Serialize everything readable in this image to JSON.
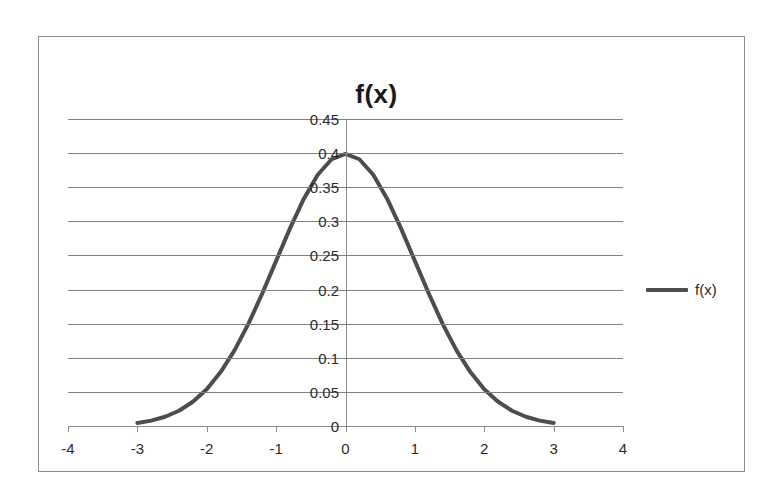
{
  "chart_data": {
    "type": "line",
    "title": "f(x)",
    "xlabel": "",
    "ylabel": "",
    "grid": true,
    "legend_position": "right",
    "legend": [
      "f(x)"
    ],
    "xlim": [
      -4,
      4
    ],
    "ylim": [
      0,
      0.45
    ],
    "x_ticks": [
      "-4",
      "-3",
      "-2",
      "-1",
      "0",
      "1",
      "2",
      "3",
      "4"
    ],
    "x_tick_values": [
      -4,
      -3,
      -2,
      -1,
      0,
      1,
      2,
      3,
      4
    ],
    "y_ticks": [
      "0",
      "0.05",
      "0.1",
      "0.15",
      "0.2",
      "0.25",
      "0.3",
      "0.35",
      "0.4",
      "0.45"
    ],
    "y_tick_values": [
      0,
      0.05,
      0.1,
      0.15,
      0.2,
      0.25,
      0.3,
      0.35,
      0.4,
      0.45
    ],
    "series": [
      {
        "name": "f(x)",
        "color": "#4d4d4d",
        "x": [
          -3,
          -2.8,
          -2.6,
          -2.4,
          -2.2,
          -2,
          -1.8,
          -1.6,
          -1.4,
          -1.2,
          -1,
          -0.8,
          -0.6,
          -0.4,
          -0.2,
          0,
          0.2,
          0.4,
          0.6,
          0.8,
          1,
          1.2,
          1.4,
          1.6,
          1.8,
          2,
          2.2,
          2.4,
          2.6,
          2.8,
          3
        ],
        "values": [
          0.0044,
          0.0079,
          0.0136,
          0.0224,
          0.0355,
          0.054,
          0.079,
          0.1109,
          0.1497,
          0.1942,
          0.242,
          0.2897,
          0.3332,
          0.3683,
          0.391,
          0.3989,
          0.391,
          0.3683,
          0.3332,
          0.2897,
          0.242,
          0.1942,
          0.1497,
          0.1109,
          0.079,
          0.054,
          0.0355,
          0.0224,
          0.0136,
          0.0079,
          0.0044
        ]
      }
    ]
  },
  "chart": {
    "title": "f(x)",
    "legend_label": "f(x)"
  }
}
